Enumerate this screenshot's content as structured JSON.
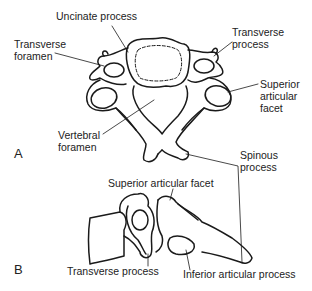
{
  "figure": {
    "panels": [
      {
        "id": "A",
        "letter": "A",
        "view": "superior view",
        "labels": {
          "uncinate_process": "Uncinate process",
          "transverse_foramen": "Transverse\nforamen",
          "transverse_process": "Transverse\nprocess",
          "superior_articular_facet": "Superior\narticular\nfacet",
          "vertebral_foramen": "Vertebral\nforamen",
          "spinous_process": "Spinous\nprocess"
        }
      },
      {
        "id": "B",
        "letter": "B",
        "view": "lateral view",
        "labels": {
          "superior_articular_facet": "Superior articular facet",
          "transverse_process": "Transverse process",
          "inferior_articular_process": "Inferior articular process"
        }
      }
    ],
    "colors": {
      "line": "#1a1a1a",
      "fill": "#ffffff",
      "text": "#222222"
    }
  }
}
